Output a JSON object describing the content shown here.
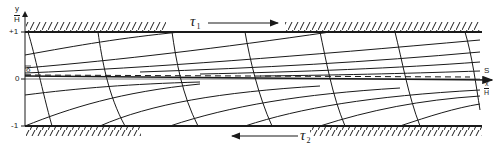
{
  "diagram": {
    "type": "flow-field-between-plates",
    "axis": {
      "y_label_top": "y",
      "y_label_bottom": "H",
      "tick_top": "+1",
      "tick_zero": "0",
      "tick_bottom": "-1",
      "delta_label": "δ"
    },
    "right_labels": {
      "s_label": "S",
      "x_label_top": "x",
      "x_label_bottom": "H"
    },
    "stresses": {
      "top": {
        "symbol": "τ",
        "subscript": "1",
        "direction": "right"
      },
      "bottom": {
        "symbol": "τ",
        "subscript": "2",
        "direction": "left"
      }
    },
    "colors": {
      "ink": "#1a1a1a",
      "background": "#ffffff"
    }
  }
}
